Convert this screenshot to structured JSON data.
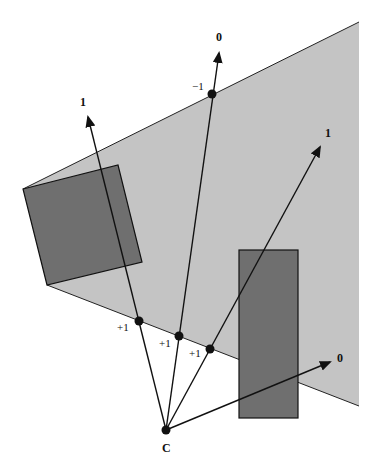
{
  "diagram": {
    "colors": {
      "region": "#c4c4c4",
      "occluder": "#6f6f6f",
      "stroke": "#111111",
      "background": "#ffffff"
    },
    "camera_label": "C",
    "ray_end_labels": {
      "left_ray": "1",
      "middle_ray": "0",
      "right_ray": "1",
      "bottom_ray": "0"
    },
    "crossing_labels": {
      "top_crossing": "−1",
      "bottom_crossing_1": "+1",
      "bottom_crossing_2": "+1",
      "bottom_crossing_3": "+1"
    }
  }
}
